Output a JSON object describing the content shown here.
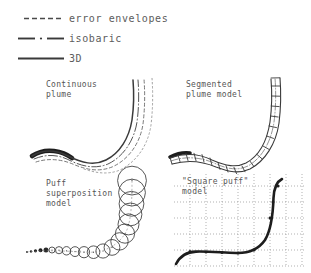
{
  "figure": {
    "background_color": "#ffffff",
    "ink_color": "#3a3a3a",
    "text_color": "#555555"
  },
  "legend": {
    "items": [
      {
        "style": "dashed",
        "icon": "dashed-line-icon",
        "label": "error envelopes"
      },
      {
        "style": "dash-dot",
        "icon": "dash-dot-line-icon",
        "label": "isobaric"
      },
      {
        "style": "solid",
        "icon": "solid-line-icon",
        "label": "3D"
      }
    ]
  },
  "panels": [
    {
      "id": "continuous",
      "label": "Continuous\nplume",
      "label_lines": [
        "Continuous",
        "plume"
      ],
      "art": "continuous-plume-diagram"
    },
    {
      "id": "segmented",
      "label": "Segmented\nplume model",
      "label_lines": [
        "Segmented",
        "plume model"
      ],
      "art": "segmented-plume-diagram"
    },
    {
      "id": "puff",
      "label": "Puff\nsuperposition\nmodel",
      "label_lines": [
        "Puff",
        "superposition",
        "model"
      ],
      "art": "puff-superposition-diagram"
    },
    {
      "id": "square",
      "label": "\"Square puff\"\nmodel",
      "label_lines": [
        "\"Square puff\"",
        "model"
      ],
      "art": "square-puff-grid-diagram"
    }
  ]
}
